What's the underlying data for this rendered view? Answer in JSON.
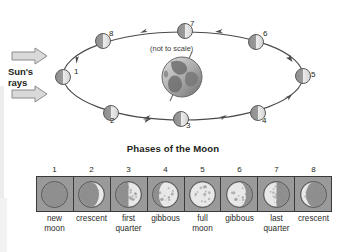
{
  "diagram": {
    "title": "Phases of the Moon",
    "sun_label_line1": "Sun's",
    "sun_label_line2": "rays",
    "scale_note": "(not to scale)",
    "orbit_positions": [
      {
        "num": "1",
        "x": 63,
        "y": 77,
        "label_x": 74,
        "label_y": 73,
        "lit": "right-half"
      },
      {
        "num": "2",
        "x": 111,
        "y": 113,
        "label_x": 114,
        "label_y": 120,
        "lit": "right-half"
      },
      {
        "num": "3",
        "x": 181,
        "y": 119,
        "label_x": 190,
        "label_y": 124,
        "lit": "right-half"
      },
      {
        "num": "4",
        "x": 258,
        "y": 113,
        "label_x": 265,
        "label_y": 120,
        "lit": "right-half"
      },
      {
        "num": "5",
        "x": 303,
        "y": 76,
        "label_x": 313,
        "label_y": 76,
        "lit": "right-half"
      },
      {
        "num": "6",
        "x": 256,
        "y": 42,
        "label_x": 265,
        "label_y": 36,
        "lit": "right-half"
      },
      {
        "num": "7",
        "x": 185,
        "y": 31,
        "label_x": 192,
        "label_y": 26,
        "lit": "right-half"
      },
      {
        "num": "8",
        "x": 103,
        "y": 41,
        "label_x": 111,
        "label_y": 36,
        "lit": "right-half"
      }
    ]
  },
  "phases": {
    "numbers": [
      "1",
      "2",
      "3",
      "4",
      "5",
      "6",
      "7",
      "8"
    ],
    "items": [
      {
        "num": "1",
        "name_line1": "new",
        "name_line2": "moon",
        "type": "new"
      },
      {
        "num": "2",
        "name_line1": "crescent",
        "name_line2": "",
        "type": "waxing-crescent"
      },
      {
        "num": "3",
        "name_line1": "first",
        "name_line2": "quarter",
        "type": "first-quarter"
      },
      {
        "num": "4",
        "name_line1": "gibbous",
        "name_line2": "",
        "type": "waxing-gibbous"
      },
      {
        "num": "5",
        "name_line1": "full",
        "name_line2": "moon",
        "type": "full"
      },
      {
        "num": "6",
        "name_line1": "gibbous",
        "name_line2": "",
        "type": "waning-gibbous"
      },
      {
        "num": "7",
        "name_line1": "last",
        "name_line2": "quarter",
        "type": "last-quarter"
      },
      {
        "num": "8",
        "name_line1": "crescent",
        "name_line2": "",
        "type": "waning-crescent"
      }
    ]
  },
  "colors": {
    "background": "#ffffff",
    "ink": "#231f20",
    "box_fill": "#9a9a9a",
    "box_border": "#3a3a3a",
    "moon_lit": "#e8e8e8",
    "moon_dark": "#8f8f8f",
    "arrow_fill": "#d9d9d9",
    "arrow_stroke": "#8a8a8a",
    "earth_dark": "#6e6e6e",
    "earth_light": "#c9c9c9"
  }
}
